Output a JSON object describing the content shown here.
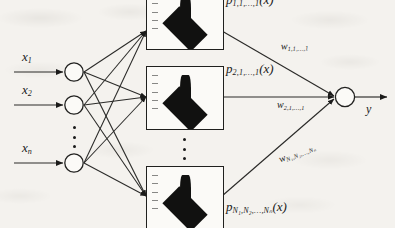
{
  "figure": {
    "background_color": "#f4f2ee",
    "ink_color": "#1a1a1a"
  },
  "inputs": {
    "label": "Input layer",
    "nodes": [
      {
        "name": "x1",
        "var": "x",
        "sub": "1"
      },
      {
        "name": "x2",
        "var": "x",
        "sub": "2"
      },
      {
        "name": "xn",
        "var": "x",
        "sub": "n"
      }
    ],
    "ellipsis": "⋮"
  },
  "hidden": {
    "label": "Rule / membership-function layer",
    "boxes": [
      {
        "name": "rule-box-1",
        "plot_label_var": "p",
        "plot_label_sub": "1,1,…,1",
        "plot_label_arg": "(x)",
        "plot_type": "3d-surface"
      },
      {
        "name": "rule-box-2",
        "plot_label_var": "p",
        "plot_label_sub": "2,1,…,1",
        "plot_label_arg": "(x)",
        "plot_type": "3d-surface"
      },
      {
        "name": "rule-box-n",
        "plot_label_var": "p",
        "plot_label_sub": "N₁,N₂,…,Nₙ",
        "plot_label_arg": "(x)",
        "plot_type": "3d-surface"
      }
    ],
    "ellipsis": "⋮"
  },
  "weights": [
    {
      "name": "w1",
      "var": "w",
      "sub": "1,1,…,1"
    },
    {
      "name": "w2",
      "var": "w",
      "sub": "2,1,…,1"
    },
    {
      "name": "wn",
      "var": "w",
      "sub": "N₁,N₂,…,Nₙ"
    }
  ],
  "output": {
    "name": "output-node",
    "label": "y"
  }
}
